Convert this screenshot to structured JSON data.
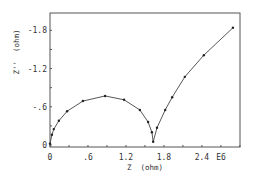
{
  "chart_data": {
    "type": "line",
    "title": "",
    "xlabel": "Z  (ohm)",
    "ylabel": "Z''  (ohm)",
    "x_scale_note": "E6",
    "xlim": [
      0,
      3.0
    ],
    "ylim": [
      0,
      -1.98
    ],
    "x_ticks": [
      {
        "value": 0,
        "label": "0"
      },
      {
        "value": 0.6,
        "label": ".6"
      },
      {
        "value": 1.2,
        "label": "1.2"
      },
      {
        "value": 1.8,
        "label": "1.8"
      },
      {
        "value": 2.4,
        "label": "2.4"
      }
    ],
    "y_ticks": [
      {
        "value": 0,
        "label": "0"
      },
      {
        "value": -0.6,
        "label": "-.6"
      },
      {
        "value": -1.2,
        "label": "-1.2"
      },
      {
        "value": -1.8,
        "label": "-1.8"
      }
    ],
    "grid": false,
    "legend": null,
    "series": [
      {
        "name": "impedance",
        "marker": "dot",
        "x": [
          0.0,
          0.03,
          0.06,
          0.14,
          0.27,
          0.52,
          0.87,
          1.17,
          1.42,
          1.55,
          1.61,
          1.63,
          1.69,
          1.82,
          1.93,
          2.13,
          2.43,
          2.89
        ],
        "y": [
          -0.02,
          -0.16,
          -0.25,
          -0.38,
          -0.53,
          -0.69,
          -0.77,
          -0.71,
          -0.55,
          -0.36,
          -0.2,
          -0.05,
          -0.27,
          -0.55,
          -0.75,
          -1.07,
          -1.41,
          -1.84
        ]
      }
    ]
  },
  "labels": {
    "x_axis_title": "Z  (ohm)",
    "y_axis_title": "Z''  (ohm)",
    "x_multiplier": "E6"
  }
}
